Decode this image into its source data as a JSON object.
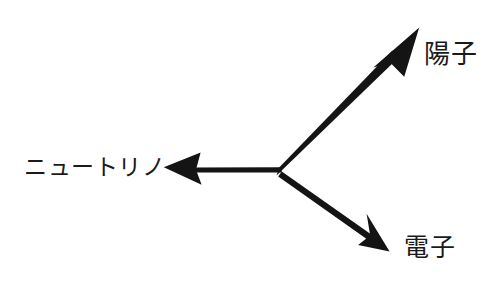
{
  "figure": {
    "kind": "vector-diagram",
    "background_color": "#ffffff",
    "ink_color": "#141414",
    "width": 488,
    "height": 281,
    "vertex": {
      "x": 279,
      "y": 171
    }
  },
  "labels": {
    "proton": "陽子",
    "electron": "電子",
    "neutrino": "ニュートリノ"
  },
  "vectors": [
    {
      "name": "proton-vector",
      "label": "陽子",
      "from": {
        "x": 279,
        "y": 171
      },
      "to": {
        "x": 418,
        "y": 29
      },
      "shaft_width": 8,
      "head_length": 44,
      "head_width": 34,
      "color": "#141414"
    },
    {
      "name": "electron-vector",
      "label": "電子",
      "from": {
        "x": 280,
        "y": 174
      },
      "to": {
        "x": 389,
        "y": 251
      },
      "shaft_width": 4,
      "head_length": 30,
      "head_width": 26,
      "color": "#141414"
    },
    {
      "name": "neutrino-vector",
      "label": "ニュートリノ",
      "from": {
        "x": 281,
        "y": 170
      },
      "to": {
        "x": 164,
        "y": 167
      },
      "shaft_width": 3,
      "head_length": 36,
      "head_width": 28,
      "color": "#141414"
    }
  ]
}
